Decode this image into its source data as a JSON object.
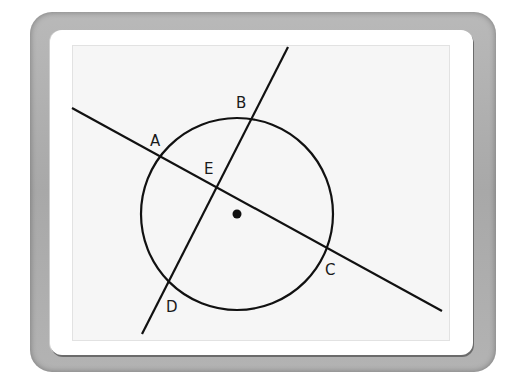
{
  "figure": {
    "type": "geometry-diagram",
    "circle": {
      "center": [
        237,
        214
      ],
      "radius": 96,
      "center_marker": "dot"
    },
    "lines": [
      {
        "name": "line-AC",
        "from": [
          72,
          108
        ],
        "to": [
          442,
          311
        ]
      },
      {
        "name": "line-BD",
        "from": [
          288,
          47
        ],
        "to": [
          142,
          334
        ]
      }
    ],
    "points": [
      {
        "label": "A",
        "pos": [
          160,
          157
        ],
        "label_pos": [
          150,
          146
        ]
      },
      {
        "label": "B",
        "pos": [
          253,
          119
        ],
        "label_pos": [
          236,
          108
        ]
      },
      {
        "label": "C",
        "pos": [
          327,
          245
        ],
        "label_pos": [
          325,
          275
        ]
      },
      {
        "label": "D",
        "pos": [
          169,
          281
        ],
        "label_pos": [
          166,
          312
        ]
      },
      {
        "label": "E",
        "pos": [
          217,
          187
        ],
        "label_pos": [
          204,
          174
        ]
      }
    ],
    "colors": {
      "stroke": "#111111",
      "screen": "#f6f6f6",
      "bezel": "#b0b0b0"
    }
  }
}
